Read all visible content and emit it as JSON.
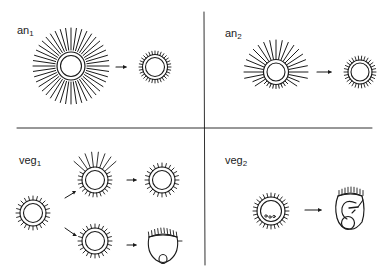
{
  "figure": {
    "background": "#ffffff",
    "stroke": "#1a1a1a",
    "panels": [
      {
        "id": "an1",
        "label_base": "an",
        "label_sub": "1",
        "description": "Large cell with many long rays all around becomes cell with short ticks",
        "stages": [
          "long rays all around",
          "short ticks all around"
        ]
      },
      {
        "id": "an2",
        "label_base": "an",
        "label_sub": "2",
        "description": "Cell with long rays on top and sides, short ticks on bottom becomes cell with short ticks",
        "stages": [
          "long rays upper, short lower",
          "short ticks all around"
        ]
      },
      {
        "id": "veg1",
        "label_base": "veg",
        "label_sub": "1",
        "description": "Ticked cell splits into two paths: one gains long top rays then reverts to ticks; other becomes cup-shaped form with basal bud",
        "stages": [
          "ticked cell",
          "long top rays",
          "ticked cell",
          "ticked cell",
          "cup-shaped form with bud"
        ]
      },
      {
        "id": "veg2",
        "label_base": "veg",
        "label_sub": "2",
        "description": "Ticked cell with three dots becomes embryo-like form with internal structures",
        "stages": [
          "ticked cell with 3 dots",
          "embryo-like form"
        ]
      }
    ]
  }
}
